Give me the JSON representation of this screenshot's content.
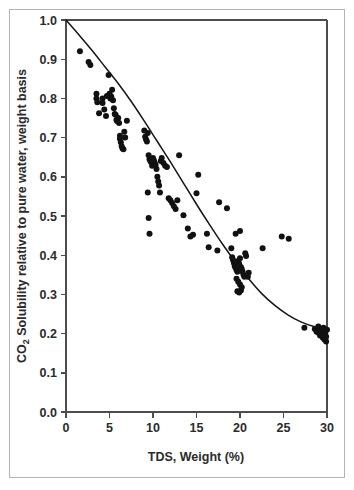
{
  "figure": {
    "border_color": "#b4b4b4",
    "background": "#ffffff"
  },
  "chart_data": {
    "type": "scatter",
    "title": "",
    "subtitle": "",
    "xlabel": "TDS, Weight (%)",
    "ylabel": "CO2 Solubility relative to pure water, weight basis",
    "ylabel_prefix": "CO",
    "ylabel_subscript": "2",
    "ylabel_rest": " Solubility relative to pure water, weight basis",
    "xlim": [
      0,
      30
    ],
    "ylim": [
      0.0,
      1.0
    ],
    "xticks": [
      0,
      5,
      10,
      15,
      20,
      25,
      30
    ],
    "xtick_labels": [
      "0",
      "5",
      "10",
      "15",
      "20",
      "25",
      "30"
    ],
    "yticks": [
      0.0,
      0.1,
      0.2,
      0.3,
      0.4,
      0.5,
      0.6,
      0.7,
      0.8,
      0.9,
      1.0
    ],
    "ytick_labels": [
      "0.0",
      "0.1",
      "0.2",
      "0.3",
      "0.4",
      "0.5",
      "0.6",
      "0.7",
      "0.8",
      "0.9",
      "1.0"
    ],
    "grid": false,
    "legend": null,
    "marker_color": "#111111",
    "marker_size": 3.0,
    "curve_color": "#151515",
    "series": [
      {
        "name": "Measured solubility data",
        "type": "scatter",
        "points": [
          [
            1.6,
            0.92
          ],
          [
            2.6,
            0.893
          ],
          [
            2.8,
            0.885
          ],
          [
            3.5,
            0.812
          ],
          [
            3.5,
            0.8
          ],
          [
            3.6,
            0.79
          ],
          [
            3.8,
            0.762
          ],
          [
            4.2,
            0.8
          ],
          [
            4.2,
            0.788
          ],
          [
            4.4,
            0.772
          ],
          [
            4.6,
            0.755
          ],
          [
            4.7,
            0.806
          ],
          [
            4.9,
            0.86
          ],
          [
            5.0,
            0.812
          ],
          [
            5.1,
            0.8
          ],
          [
            5.2,
            0.805
          ],
          [
            5.3,
            0.822
          ],
          [
            5.4,
            0.795
          ],
          [
            5.5,
            0.775
          ],
          [
            5.6,
            0.76
          ],
          [
            5.7,
            0.758
          ],
          [
            5.8,
            0.745
          ],
          [
            5.9,
            0.742
          ],
          [
            6.0,
            0.75
          ],
          [
            6.1,
            0.737
          ],
          [
            6.2,
            0.705
          ],
          [
            6.2,
            0.697
          ],
          [
            6.3,
            0.688
          ],
          [
            6.4,
            0.678
          ],
          [
            6.5,
            0.672
          ],
          [
            6.6,
            0.67
          ],
          [
            6.7,
            0.715
          ],
          [
            6.8,
            0.7
          ],
          [
            7.0,
            0.743
          ],
          [
            9.0,
            0.718
          ],
          [
            9.1,
            0.702
          ],
          [
            9.2,
            0.695
          ],
          [
            9.3,
            0.69
          ],
          [
            9.4,
            0.712
          ],
          [
            9.5,
            0.655
          ],
          [
            9.6,
            0.645
          ],
          [
            9.7,
            0.64
          ],
          [
            9.8,
            0.637
          ],
          [
            9.9,
            0.628
          ],
          [
            10.0,
            0.648
          ],
          [
            10.1,
            0.642
          ],
          [
            10.2,
            0.636
          ],
          [
            10.3,
            0.63
          ],
          [
            10.4,
            0.62
          ],
          [
            10.5,
            0.6
          ],
          [
            10.6,
            0.588
          ],
          [
            10.7,
            0.578
          ],
          [
            10.8,
            0.56
          ],
          [
            9.4,
            0.56
          ],
          [
            9.5,
            0.495
          ],
          [
            9.6,
            0.455
          ],
          [
            10.9,
            0.64
          ],
          [
            11.0,
            0.648
          ],
          [
            11.2,
            0.635
          ],
          [
            11.4,
            0.628
          ],
          [
            11.6,
            0.625
          ],
          [
            11.8,
            0.545
          ],
          [
            12.0,
            0.54
          ],
          [
            12.2,
            0.533
          ],
          [
            12.4,
            0.525
          ],
          [
            12.6,
            0.518
          ],
          [
            12.8,
            0.54
          ],
          [
            13.5,
            0.502
          ],
          [
            14.0,
            0.468
          ],
          [
            14.3,
            0.448
          ],
          [
            14.6,
            0.452
          ],
          [
            13.0,
            0.655
          ],
          [
            15.2,
            0.605
          ],
          [
            15.0,
            0.558
          ],
          [
            16.2,
            0.455
          ],
          [
            16.4,
            0.42
          ],
          [
            17.4,
            0.412
          ],
          [
            17.6,
            0.535
          ],
          [
            18.5,
            0.52
          ],
          [
            19.0,
            0.418
          ],
          [
            19.1,
            0.395
          ],
          [
            19.2,
            0.388
          ],
          [
            19.3,
            0.38
          ],
          [
            19.4,
            0.372
          ],
          [
            19.5,
            0.368
          ],
          [
            19.6,
            0.362
          ],
          [
            19.7,
            0.358
          ],
          [
            19.8,
            0.385
          ],
          [
            19.9,
            0.378
          ],
          [
            20.0,
            0.392
          ],
          [
            20.1,
            0.37
          ],
          [
            20.2,
            0.365
          ],
          [
            20.3,
            0.358
          ],
          [
            20.4,
            0.35
          ],
          [
            20.5,
            0.345
          ],
          [
            19.6,
            0.34
          ],
          [
            19.8,
            0.332
          ],
          [
            20.0,
            0.325
          ],
          [
            20.2,
            0.318
          ],
          [
            19.7,
            0.308
          ],
          [
            19.9,
            0.305
          ],
          [
            20.1,
            0.31
          ],
          [
            20.6,
            0.405
          ],
          [
            20.7,
            0.398
          ],
          [
            20.9,
            0.345
          ],
          [
            21.0,
            0.355
          ],
          [
            19.5,
            0.455
          ],
          [
            20.0,
            0.462
          ],
          [
            22.6,
            0.418
          ],
          [
            24.8,
            0.448
          ],
          [
            25.6,
            0.442
          ],
          [
            27.4,
            0.215
          ],
          [
            28.6,
            0.212
          ],
          [
            28.8,
            0.205
          ],
          [
            29.0,
            0.218
          ],
          [
            29.1,
            0.2
          ],
          [
            29.2,
            0.195
          ],
          [
            29.3,
            0.212
          ],
          [
            29.4,
            0.205
          ],
          [
            29.5,
            0.198
          ],
          [
            29.5,
            0.19
          ],
          [
            29.6,
            0.215
          ],
          [
            29.7,
            0.208
          ],
          [
            29.7,
            0.185
          ],
          [
            29.8,
            0.2
          ],
          [
            29.9,
            0.192
          ],
          [
            29.9,
            0.18
          ],
          [
            30.0,
            0.21
          ]
        ]
      },
      {
        "name": "Correlation fit curve",
        "type": "line",
        "points": [
          [
            0.0,
            1.0
          ],
          [
            1.5,
            0.962
          ],
          [
            3.0,
            0.922
          ],
          [
            4.5,
            0.88
          ],
          [
            6.0,
            0.838
          ],
          [
            7.5,
            0.792
          ],
          [
            9.0,
            0.742
          ],
          [
            10.5,
            0.69
          ],
          [
            12.0,
            0.638
          ],
          [
            13.5,
            0.584
          ],
          [
            15.0,
            0.53
          ],
          [
            16.5,
            0.478
          ],
          [
            18.0,
            0.428
          ],
          [
            19.5,
            0.382
          ],
          [
            21.0,
            0.34
          ],
          [
            22.5,
            0.302
          ],
          [
            24.0,
            0.272
          ],
          [
            25.5,
            0.248
          ],
          [
            27.0,
            0.23
          ],
          [
            28.5,
            0.218
          ],
          [
            30.0,
            0.21
          ]
        ]
      }
    ]
  }
}
